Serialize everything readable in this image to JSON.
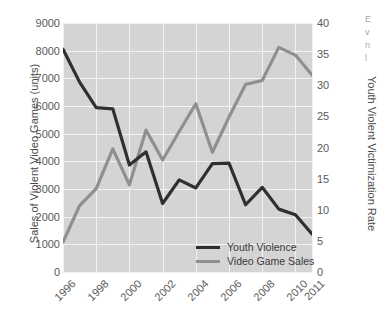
{
  "chart_data": {
    "type": "line",
    "title": "",
    "xlabel": "",
    "ylabel": "Sales of Violent Video Games (units)",
    "ylabel_right": "Youth Violent Victimization Rate",
    "grid": true,
    "legend_position": "bottom-right",
    "x": [
      1996,
      1997,
      1998,
      1999,
      2000,
      2001,
      2002,
      2003,
      2004,
      2005,
      2006,
      2007,
      2008,
      2009,
      2010,
      2011
    ],
    "xtick_labels": [
      "1996",
      "1998",
      "2000",
      "2002",
      "2004",
      "2006",
      "2008",
      "2010",
      "2011"
    ],
    "xtick_values": [
      1996,
      1998,
      2000,
      2002,
      2004,
      2006,
      2008,
      2010,
      2011
    ],
    "xlim": [
      1996,
      2011
    ],
    "ylim": [
      0,
      9000
    ],
    "ytick_labels": [
      "0",
      "1000",
      "2000",
      "3000",
      "4000",
      "5000",
      "6000",
      "7000",
      "8000",
      "9000"
    ],
    "ytick_values": [
      0,
      1000,
      2000,
      3000,
      4000,
      5000,
      6000,
      7000,
      8000,
      9000
    ],
    "ylim_right": [
      0,
      40
    ],
    "ytick_right_labels": [
      "0",
      "5",
      "10",
      "15",
      "20",
      "25",
      "30",
      "35",
      "40"
    ],
    "ytick_right_values": [
      0,
      5,
      10,
      15,
      20,
      25,
      30,
      35,
      40
    ],
    "series": [
      {
        "name": "Youth Violence",
        "axis": "right",
        "color": "#2f2f2f",
        "values": [
          35.8,
          30.5,
          26.4,
          26.2,
          17.2,
          19.3,
          11.0,
          14.8,
          13.5,
          17.4,
          17.5,
          10.8,
          13.6,
          10.1,
          9.2,
          6.1
        ]
      },
      {
        "name": "Video Game Sales",
        "axis": "left",
        "color": "#8f8f8f",
        "values": [
          1080,
          2400,
          3010,
          4450,
          3150,
          5130,
          4050,
          5080,
          6080,
          4330,
          5600,
          6780,
          6920,
          8120,
          7840,
          7120
        ]
      }
    ],
    "legend": [
      "Youth Violence",
      "Video Game Sales"
    ]
  },
  "colors": {
    "plot_background": "#d4d4d4",
    "gridline": "#f2f2f2",
    "page_background": "#ffffff",
    "youth_violence": "#2f2f2f",
    "video_game_sales": "#8f8f8f",
    "tick_text": "#5a5a5a",
    "axis_title_text": "#4c4c4c"
  },
  "margin_notes": [
    "E",
    "v",
    "n",
    "l"
  ]
}
